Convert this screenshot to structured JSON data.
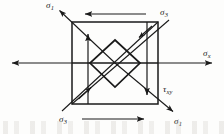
{
  "figure": {
    "canvas": {
      "width": 224,
      "height": 134
    },
    "background_color": "#fdfdfc",
    "line_color": "#1a1a1a",
    "label_color": "#1a1a1a"
  },
  "labels": {
    "sigma1_top_left": {
      "symbol": "σ",
      "sub": "1",
      "x": 46,
      "y": 1
    },
    "sigma3_top_right": {
      "symbol": "σ",
      "sub": "3",
      "x": 160,
      "y": 8
    },
    "sigma_x_right": {
      "symbol": "σ",
      "sub": "x",
      "x": 203,
      "y": 49
    },
    "tau_xy_right": {
      "symbol": "τ",
      "sub": "xy",
      "x": 163,
      "y": 85
    },
    "sigma3_bottom_left": {
      "symbol": "σ",
      "sub": "3",
      "x": 59,
      "y": 115
    },
    "sigma1_bottom_right": {
      "symbol": "σ",
      "sub": "1",
      "x": 174,
      "y": 117
    }
  },
  "geometry": {
    "outer_square": {
      "left": 72,
      "top": 22,
      "right": 158,
      "bottom": 104
    },
    "inner_diamond": {
      "top": {
        "x": 115,
        "y": 40
      },
      "right": {
        "x": 140,
        "y": 63
      },
      "bottom": {
        "x": 115,
        "y": 87
      },
      "left": {
        "x": 90,
        "y": 63
      }
    },
    "normal_stress_arrows": {
      "left_horizontal": {
        "from_x": 158,
        "to_x": 10,
        "y": 63,
        "direction": "left"
      },
      "right_horizontal": {
        "from_x": 72,
        "to_x": 214,
        "y": 63,
        "direction": "right"
      },
      "left_vertical": {
        "x": 88,
        "from_y": 104,
        "to_y": 32,
        "direction": "up"
      },
      "right_vertical": {
        "x": 147,
        "from_y": 22,
        "to_y": 97,
        "direction": "down"
      }
    },
    "shear_arrows": {
      "top_edge": {
        "y": 14,
        "from_x": 144,
        "to_x": 83,
        "direction": "left"
      },
      "bottom_edge": {
        "y": 119,
        "from_x": 84,
        "to_x": 146,
        "direction": "right"
      }
    },
    "principal_arrows": {
      "sigma1_upper_left": {
        "from_x": 115,
        "from_y": 63,
        "to_x": 58,
        "to_y": 9
      },
      "sigma1_lower_right": {
        "from_x": 115,
        "from_y": 63,
        "to_x": 175,
        "to_y": 113
      },
      "sigma3_upper_right": {
        "from_x": 90,
        "from_y": 88,
        "to_x": 171,
        "to_y": 18
      },
      "sigma3_lower_left": {
        "from_x": 141,
        "from_y": 39,
        "to_x": 62,
        "to_y": 110
      }
    }
  },
  "annotations": {
    "description": "Square stress element under sigma-x and tau-xy, with inscribed rotated element oriented along principal directions sigma-1 and sigma-3"
  }
}
